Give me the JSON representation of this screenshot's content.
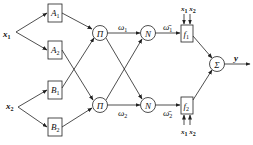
{
  "diagram": {
    "type": "ANFIS network structure",
    "inputs": [
      {
        "id": "x1",
        "label": "x",
        "sub": "1"
      },
      {
        "id": "x2",
        "label": "x",
        "sub": "2"
      }
    ],
    "layer1": [
      {
        "id": "A1",
        "label": "A",
        "sub": "1"
      },
      {
        "id": "A2",
        "label": "A",
        "sub": "2"
      },
      {
        "id": "B1",
        "label": "B",
        "sub": "1"
      },
      {
        "id": "B2",
        "label": "B",
        "sub": "2"
      }
    ],
    "layer2": [
      {
        "id": "P1",
        "label": "Π"
      },
      {
        "id": "P2",
        "label": "Π"
      }
    ],
    "layer2_outputs": [
      {
        "label": "ω",
        "sub": "1"
      },
      {
        "label": "ω",
        "sub": "2"
      }
    ],
    "layer3": [
      {
        "id": "N1",
        "label": "N"
      },
      {
        "id": "N2",
        "label": "N"
      }
    ],
    "layer3_outputs": [
      {
        "label": "ω̄",
        "sub": "1"
      },
      {
        "label": "ω̄",
        "sub": "2"
      }
    ],
    "layer4": [
      {
        "id": "f1",
        "label": "f",
        "sub": "1",
        "inputs_label": "x1 x2"
      },
      {
        "id": "f2",
        "label": "f",
        "sub": "2",
        "inputs_label": "x1 x2"
      }
    ],
    "layer5": {
      "id": "sum",
      "label": "Σ"
    },
    "output": {
      "label": "y"
    },
    "edges": [
      [
        "x1",
        "A1"
      ],
      [
        "x1",
        "A2"
      ],
      [
        "x2",
        "B1"
      ],
      [
        "x2",
        "B2"
      ],
      [
        "A1",
        "P1"
      ],
      [
        "A2",
        "P2"
      ],
      [
        "B1",
        "P1"
      ],
      [
        "B2",
        "P2"
      ],
      [
        "P1",
        "N1"
      ],
      [
        "P1",
        "N2"
      ],
      [
        "P2",
        "N1"
      ],
      [
        "P2",
        "N2"
      ],
      [
        "N1",
        "f1"
      ],
      [
        "N2",
        "f2"
      ],
      [
        "f1",
        "sum"
      ],
      [
        "f2",
        "sum"
      ],
      [
        "sum",
        "y"
      ]
    ]
  }
}
